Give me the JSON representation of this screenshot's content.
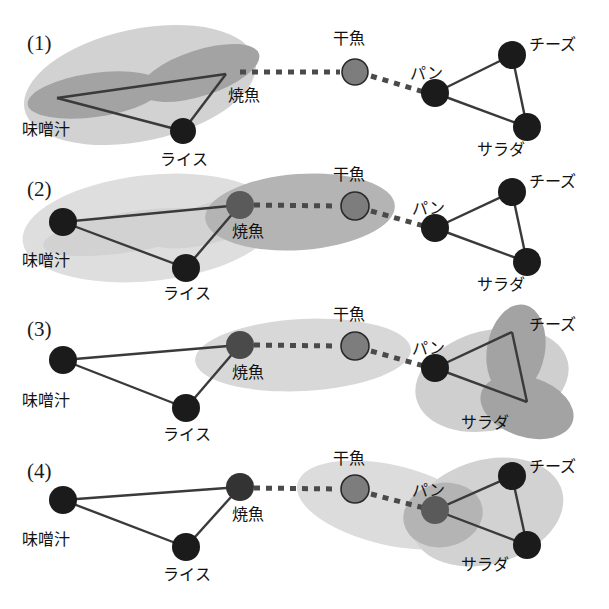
{
  "figure": {
    "title": "",
    "background_color": "#ffffff",
    "palette": {
      "node_dark": "#1b1b1b",
      "node_gray": "#7d7d7d",
      "node_mid": "#5a5a5a",
      "edge": "#3a3a3a",
      "dashed_edge": "#4a4a4a",
      "blob_light": "#d2d2d2",
      "blob_lighter": "#dedede",
      "blob_dark": "#a3a3a3",
      "blob_mid": "#b4b4b4",
      "label_text": "#111111"
    },
    "node_labels": {
      "miso": "味噌汁",
      "rice": "ライス",
      "grilled_fish": "焼魚",
      "dried_fish": "干魚",
      "bread": "パン",
      "cheese": "チーズ",
      "salad": "サラダ"
    },
    "rows": [
      {
        "id": "row-1",
        "label": "(1)",
        "nodes": [
          {
            "key": "miso",
            "label": "味噌汁",
            "style": "dark",
            "hidden_under_blob": true
          },
          {
            "key": "rice",
            "label": "ライス",
            "style": "dark",
            "hidden_under_blob": false
          },
          {
            "key": "grilled_fish",
            "label": "焼魚",
            "style": "dark",
            "hidden_under_blob": true
          },
          {
            "key": "dried_fish",
            "label": "干魚",
            "style": "gray",
            "hidden_under_blob": false
          },
          {
            "key": "bread",
            "label": "パン",
            "style": "dark",
            "hidden_under_blob": false
          },
          {
            "key": "cheese",
            "label": "チーズ",
            "style": "dark",
            "hidden_under_blob": false
          },
          {
            "key": "salad",
            "label": "サラダ",
            "style": "dark",
            "hidden_under_blob": false
          }
        ],
        "solid_edges": [
          [
            "miso",
            "rice"
          ],
          [
            "miso",
            "grilled_fish"
          ],
          [
            "rice",
            "grilled_fish"
          ],
          [
            "bread",
            "cheese"
          ],
          [
            "bread",
            "salad"
          ],
          [
            "cheese",
            "salad"
          ]
        ],
        "dashed_edges": [
          [
            "grilled_fish",
            "dried_fish"
          ],
          [
            "dried_fish",
            "bread"
          ]
        ],
        "clusters": [
          {
            "name": "left-triangle-cluster",
            "shade": "light",
            "covers": [
              "miso",
              "rice",
              "grilled_fish"
            ]
          },
          {
            "name": "left-lobe-miso",
            "shade": "dark",
            "covers": [
              "miso"
            ]
          },
          {
            "name": "left-lobe-grilled-fish",
            "shade": "dark",
            "covers": [
              "grilled_fish"
            ]
          }
        ]
      },
      {
        "id": "row-2",
        "label": "(2)",
        "nodes": [
          {
            "key": "miso",
            "label": "味噌汁",
            "style": "dark",
            "hidden_under_blob": false
          },
          {
            "key": "rice",
            "label": "ライス",
            "style": "dark",
            "hidden_under_blob": false
          },
          {
            "key": "grilled_fish",
            "label": "焼魚",
            "style": "mid",
            "hidden_under_blob": false
          },
          {
            "key": "dried_fish",
            "label": "干魚",
            "style": "gray",
            "hidden_under_blob": false
          },
          {
            "key": "bread",
            "label": "パン",
            "style": "dark",
            "hidden_under_blob": false
          },
          {
            "key": "cheese",
            "label": "チーズ",
            "style": "dark",
            "hidden_under_blob": false
          },
          {
            "key": "salad",
            "label": "サラダ",
            "style": "dark",
            "hidden_under_blob": false
          }
        ],
        "solid_edges": [
          [
            "miso",
            "rice"
          ],
          [
            "miso",
            "grilled_fish"
          ],
          [
            "rice",
            "grilled_fish"
          ],
          [
            "bread",
            "cheese"
          ],
          [
            "bread",
            "salad"
          ],
          [
            "cheese",
            "salad"
          ]
        ],
        "dashed_edges": [
          [
            "grilled_fish",
            "dried_fish"
          ],
          [
            "dried_fish",
            "bread"
          ]
        ],
        "clusters": [
          {
            "name": "left-triangle-cluster",
            "shade": "lighter",
            "covers": [
              "miso",
              "rice",
              "grilled_fish"
            ]
          },
          {
            "name": "fish-pair-cluster",
            "shade": "mid",
            "covers": [
              "grilled_fish",
              "dried_fish"
            ]
          }
        ]
      },
      {
        "id": "row-3",
        "label": "(3)",
        "nodes": [
          {
            "key": "miso",
            "label": "味噌汁",
            "style": "dark",
            "hidden_under_blob": false
          },
          {
            "key": "rice",
            "label": "ライス",
            "style": "dark",
            "hidden_under_blob": false
          },
          {
            "key": "grilled_fish",
            "label": "焼魚",
            "style": "mid",
            "hidden_under_blob": false
          },
          {
            "key": "dried_fish",
            "label": "干魚",
            "style": "gray",
            "hidden_under_blob": false
          },
          {
            "key": "bread",
            "label": "パン",
            "style": "dark",
            "hidden_under_blob": false
          },
          {
            "key": "cheese",
            "label": "チーズ",
            "style": "dark",
            "hidden_under_blob": true
          },
          {
            "key": "salad",
            "label": "サラダ",
            "style": "dark",
            "hidden_under_blob": true
          }
        ],
        "solid_edges": [
          [
            "miso",
            "rice"
          ],
          [
            "miso",
            "grilled_fish"
          ],
          [
            "rice",
            "grilled_fish"
          ],
          [
            "bread",
            "cheese"
          ],
          [
            "bread",
            "salad"
          ],
          [
            "cheese",
            "salad"
          ]
        ],
        "dashed_edges": [
          [
            "grilled_fish",
            "dried_fish"
          ],
          [
            "dried_fish",
            "bread"
          ]
        ],
        "clusters": [
          {
            "name": "fish-pair-cluster",
            "shade": "light",
            "covers": [
              "grilled_fish",
              "dried_fish"
            ]
          },
          {
            "name": "right-triangle-cluster",
            "shade": "light",
            "covers": [
              "bread",
              "cheese",
              "salad"
            ]
          },
          {
            "name": "right-lobe-cheese",
            "shade": "dark",
            "covers": [
              "cheese"
            ]
          },
          {
            "name": "right-lobe-salad",
            "shade": "dark",
            "covers": [
              "salad"
            ]
          }
        ]
      },
      {
        "id": "row-4",
        "label": "(4)",
        "nodes": [
          {
            "key": "miso",
            "label": "味噌汁",
            "style": "dark",
            "hidden_under_blob": false
          },
          {
            "key": "rice",
            "label": "ライス",
            "style": "dark",
            "hidden_under_blob": false
          },
          {
            "key": "grilled_fish",
            "label": "焼魚",
            "style": "dark",
            "hidden_under_blob": false
          },
          {
            "key": "dried_fish",
            "label": "干魚",
            "style": "gray",
            "hidden_under_blob": false
          },
          {
            "key": "bread",
            "label": "パン",
            "style": "mid",
            "hidden_under_blob": false
          },
          {
            "key": "cheese",
            "label": "チーズ",
            "style": "dark",
            "hidden_under_blob": false
          },
          {
            "key": "salad",
            "label": "サラダ",
            "style": "dark",
            "hidden_under_blob": false
          }
        ],
        "solid_edges": [
          [
            "miso",
            "rice"
          ],
          [
            "miso",
            "grilled_fish"
          ],
          [
            "rice",
            "grilled_fish"
          ],
          [
            "bread",
            "cheese"
          ],
          [
            "bread",
            "salad"
          ],
          [
            "cheese",
            "salad"
          ]
        ],
        "dashed_edges": [
          [
            "grilled_fish",
            "dried_fish"
          ],
          [
            "dried_fish",
            "bread"
          ]
        ],
        "clusters": [
          {
            "name": "dried-fish-bread-cluster",
            "shade": "lighter",
            "covers": [
              "dried_fish",
              "bread"
            ]
          },
          {
            "name": "right-triangle-cluster",
            "shade": "light",
            "covers": [
              "bread",
              "cheese",
              "salad"
            ]
          },
          {
            "name": "right-lobe-bread",
            "shade": "mid",
            "covers": [
              "bread"
            ]
          }
        ]
      }
    ]
  }
}
